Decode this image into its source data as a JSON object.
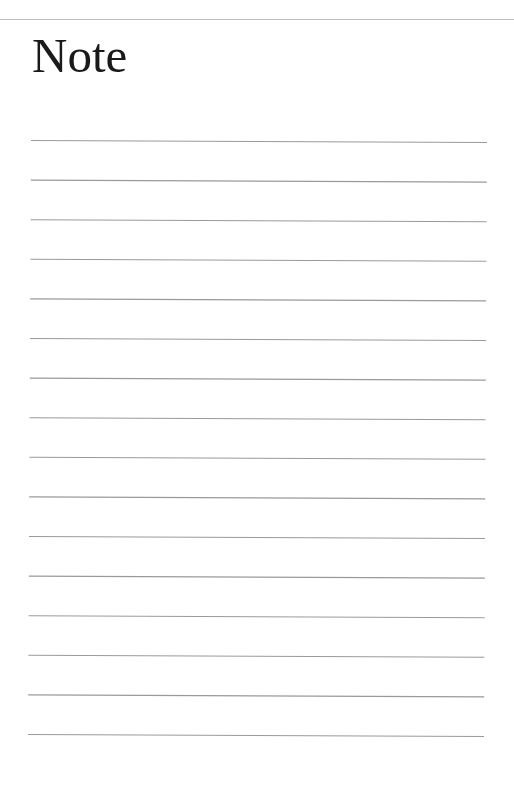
{
  "page": {
    "title": "Note",
    "colors": {
      "background": "#ffffff",
      "title_text": "#1a1a1a",
      "top_rule": "#bdbdbd",
      "ruled_line": "#9a9a9a"
    },
    "ruled_lines": {
      "count": 16,
      "first_y": 140,
      "spacing": 39.6,
      "x_start": 31,
      "x_end": 487
    }
  }
}
